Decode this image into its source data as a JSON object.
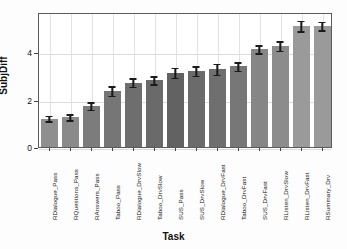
{
  "chart_data": {
    "type": "bar",
    "title": "",
    "xlabel": "Task",
    "ylabel": "SubjDiff",
    "categories": [
      "RDialogue_Pass",
      "RQuestions_Pass",
      "RAnswers_Pass",
      "Taboo_Pass",
      "RDialogue_DrvSlow",
      "Taboo_DrvSlow",
      "SUS_Pass",
      "SUS_DrvSlow",
      "RDialogue_DrvFast",
      "Taboo_DrvFast",
      "SUS_DrvFast",
      "RListen_DrvSlow",
      "RListen_DrvFast",
      "RSummary_Drv"
    ],
    "values": [
      1.2,
      1.25,
      1.73,
      2.37,
      2.72,
      2.82,
      3.13,
      3.2,
      3.28,
      3.4,
      4.13,
      4.27,
      5.1,
      5.1
    ],
    "errors": [
      0.12,
      0.13,
      0.15,
      0.2,
      0.18,
      0.17,
      0.22,
      0.2,
      0.22,
      0.18,
      0.17,
      0.2,
      0.22,
      0.18
    ],
    "bar_colors": [
      "#8f8f8f",
      "#8a8a8a",
      "#7c7c7c",
      "#767676",
      "#6e6e6e",
      "#6a6a6a",
      "#626262",
      "#6b6b6b",
      "#6f6f6f",
      "#777777",
      "#868686",
      "#8c8c8c",
      "#9a9a9a",
      "#9a9a9a"
    ],
    "ytick_labels": [
      "0",
      "2",
      "4"
    ],
    "ytick_values": [
      0,
      2,
      4
    ],
    "ylim": [
      0,
      5.7
    ],
    "grid": "both",
    "legend": "none",
    "error_bar_color": "#1a1a1a",
    "frame_color": "#5a5a5a",
    "grid_color": "#e2e2e2"
  }
}
